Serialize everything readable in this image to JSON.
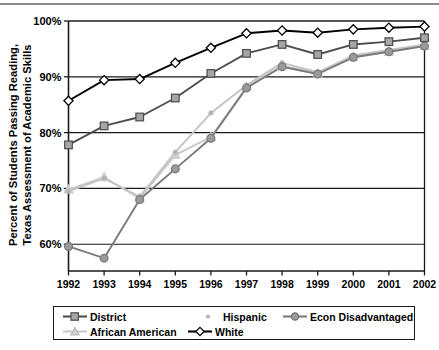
{
  "chart_data": {
    "type": "line",
    "title": "",
    "subtitle": "",
    "xlabel": "",
    "ylabel": "Percent of Students Passing Reading, Texas Assessment of Academic Skills",
    "ylabel_line1": "Percent of Students Passing Reading,",
    "ylabel_line2": "Texas Assessment of Academic Skills",
    "categories": [
      "1992",
      "1993",
      "1994",
      "1995",
      "1996",
      "1997",
      "1998",
      "1999",
      "2000",
      "2001",
      "2002"
    ],
    "x": [
      1992,
      1993,
      1994,
      1995,
      1996,
      1997,
      1998,
      1999,
      2000,
      2001,
      2002
    ],
    "ylim": [
      55,
      100
    ],
    "ytick_values": [
      60,
      70,
      80,
      90,
      100
    ],
    "ytick_labels": [
      "60%",
      "70%",
      "80%",
      "90%",
      "100%"
    ],
    "grid": "horizontal",
    "legend_position": "bottom",
    "series": [
      {
        "name": "District",
        "color": "#4d4d4d",
        "marker": "square",
        "marker_fill": "#a6a6a6",
        "values": [
          77.8,
          81.2,
          82.8,
          86.2,
          90.6,
          94.2,
          95.8,
          94.0,
          95.8,
          96.3,
          97.0
        ]
      },
      {
        "name": "Hispanic",
        "color": "#c4c4c4",
        "marker": "dot",
        "marker_fill": "#b5b5b5",
        "values": [
          69.5,
          71.8,
          68.5,
          76.5,
          83.5,
          88.5,
          92.5,
          90.8,
          93.8,
          94.8,
          95.8
        ]
      },
      {
        "name": "Econ Disadvantaged",
        "color": "#7a7a7a",
        "marker": "circle",
        "marker_fill": "#9a9a9a",
        "values": [
          59.6,
          57.5,
          68.0,
          73.5,
          79.0,
          88.0,
          91.8,
          90.5,
          93.5,
          94.5,
          95.5
        ]
      },
      {
        "name": "African American",
        "color": "#c9c9c9",
        "marker": "triangle",
        "marker_fill": "#d2d2d2",
        "values": [
          69.8,
          72.0,
          68.2,
          76.0,
          79.2,
          88.2,
          92.0,
          90.6,
          93.5,
          94.5,
          95.5
        ]
      },
      {
        "name": "White",
        "color": "#000000",
        "marker": "diamond",
        "marker_fill": "#ffffff",
        "values": [
          85.7,
          89.4,
          89.6,
          92.5,
          95.2,
          97.8,
          98.3,
          97.9,
          98.5,
          98.8,
          99.0
        ]
      }
    ]
  },
  "legend": {
    "items": [
      {
        "label": "District",
        "key": "district"
      },
      {
        "label": "Hispanic",
        "key": "hispanic"
      },
      {
        "label": "Econ Disadvantaged",
        "key": "econ-disadvantaged"
      },
      {
        "label": "African American",
        "key": "african-american"
      },
      {
        "label": "White",
        "key": "white"
      }
    ]
  }
}
